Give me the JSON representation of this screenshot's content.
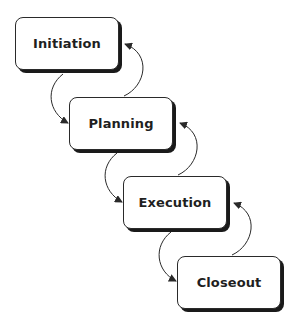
{
  "diagram": {
    "type": "waterfall-process",
    "phases": [
      {
        "id": "initiation",
        "label": "Initiation"
      },
      {
        "id": "planning",
        "label": "Planning"
      },
      {
        "id": "execution",
        "label": "Execution"
      },
      {
        "id": "closeout",
        "label": "Closeout"
      }
    ],
    "connections": [
      {
        "from": "Initiation",
        "to": "Planning",
        "direction": "forward"
      },
      {
        "from": "Planning",
        "to": "Initiation",
        "direction": "feedback"
      },
      {
        "from": "Planning",
        "to": "Execution",
        "direction": "forward"
      },
      {
        "from": "Execution",
        "to": "Planning",
        "direction": "feedback"
      },
      {
        "from": "Execution",
        "to": "Closeout",
        "direction": "forward"
      },
      {
        "from": "Closeout",
        "to": "Execution",
        "direction": "feedback"
      }
    ],
    "colors": {
      "stroke": "#2a2a2a",
      "shadow": "#1a1a1a",
      "fill": "#ffffff",
      "text": "#1f1f1f"
    }
  }
}
